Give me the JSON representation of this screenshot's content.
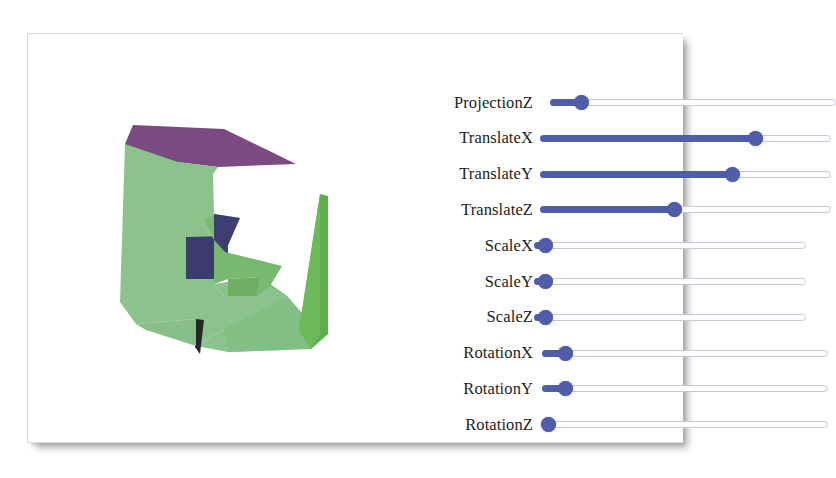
{
  "window": {
    "title": "3D Transform Viewer",
    "card_background": "#ffffff",
    "border_color": "#d9dadc"
  },
  "viewport": {
    "name": "3d-model-viewport",
    "background": "#ffffff",
    "model_description": "Extruded letter-E style polyhedron shown in perspective",
    "colors": {
      "face_light_green": "#8cc38d",
      "face_mid_green": "#77b96f",
      "face_dark_green": "#5fae4c",
      "face_purple": "#7b4a80",
      "face_navy": "#3c3c6d",
      "face_shadow_green": "#6fae62",
      "edge_dark": "#2b2b2b"
    }
  },
  "controls": {
    "panel_name": "transform-controls-panel",
    "accent_color": "#4f5dab",
    "track_color": "#fdfdff",
    "track_border_color": "#c6c9d4",
    "sliders": [
      {
        "label": "ProjectionZ",
        "value": 11,
        "track_left": 10,
        "track_right": 296
      },
      {
        "label": "TranslateX",
        "value": 74,
        "track_left": 0,
        "track_right": 291
      },
      {
        "label": "TranslateY",
        "value": 66,
        "track_left": 0,
        "track_right": 291
      },
      {
        "label": "TranslateZ",
        "value": 46,
        "track_left": 0,
        "track_right": 291
      },
      {
        "label": "ScaleX",
        "value": 4,
        "track_left": -6,
        "track_right": 266
      },
      {
        "label": "ScaleY",
        "value": 4,
        "track_left": -6,
        "track_right": 266
      },
      {
        "label": "ScaleZ",
        "value": 4,
        "track_left": -6,
        "track_right": 266
      },
      {
        "label": "RotationX",
        "value": 8,
        "track_left": 2,
        "track_right": 288
      },
      {
        "label": "RotationY",
        "value": 8,
        "track_left": 2,
        "track_right": 288
      },
      {
        "label": "RotationZ",
        "value": 2,
        "track_left": 2,
        "track_right": 288
      }
    ]
  }
}
